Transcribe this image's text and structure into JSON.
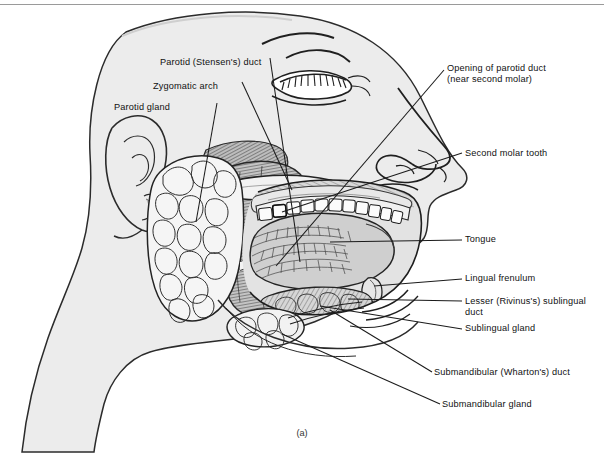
{
  "figure": {
    "caption": "(a)",
    "colors": {
      "skin_fill": "#ececec",
      "ink": "#1a1a1a",
      "gland_fill": "#f4f4f4",
      "muscle_fill": "#c9c9c9",
      "tongue_fill": "#cfcfcf",
      "tooth_fill": "#fbfbfb",
      "rule": "#9a9a9a",
      "background": "#ffffff"
    }
  },
  "labels_left": [
    {
      "text": "Parotid (Stensen's) duct",
      "x": 160,
      "y": 57
    },
    {
      "text": "Zygomatic arch",
      "x": 153,
      "y": 81
    },
    {
      "text": "Parotid gland",
      "x": 114,
      "y": 102
    }
  ],
  "labels_right": [
    {
      "text": "Opening of parotid duct",
      "x": 447,
      "y": 68
    },
    {
      "text": "(near second molar)",
      "x": 447,
      "y": 79
    },
    {
      "text": "Second molar tooth",
      "x": 465,
      "y": 152
    },
    {
      "text": "Tongue",
      "x": 465,
      "y": 238
    },
    {
      "text": "Lingual frenulum",
      "x": 465,
      "y": 277
    },
    {
      "text": "Lesser (Rivinus's) sublingual",
      "x": 465,
      "y": 300
    },
    {
      "text": "duct",
      "x": 465,
      "y": 311
    },
    {
      "text": "Sublingual gland",
      "x": 465,
      "y": 327
    },
    {
      "text": "Submandibular (Wharton's) duct",
      "x": 434,
      "y": 371
    },
    {
      "text": "Submandibular gland",
      "x": 442,
      "y": 403
    }
  ]
}
